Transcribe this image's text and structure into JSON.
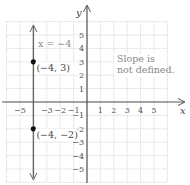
{
  "chart_data": {
    "type": "line",
    "title": "",
    "xlabel": "x",
    "ylabel": "y",
    "xlim": [
      -6,
      6
    ],
    "ylim": [
      -6,
      6
    ],
    "grid": true,
    "x_ticks": [
      -5,
      -3,
      -2,
      -1,
      1,
      2,
      3,
      4,
      5
    ],
    "y_ticks": [
      5,
      4,
      3,
      2,
      1,
      -1,
      -2,
      -3,
      -4,
      -5
    ],
    "series": [
      {
        "name": "x = -4",
        "kind": "vertical-line",
        "x": -4,
        "color": "#666666"
      }
    ],
    "points": [
      {
        "x": -4,
        "y": 3,
        "label": "(−4, 3)"
      },
      {
        "x": -4,
        "y": -2,
        "label": "(−4, −2)"
      }
    ],
    "annotations": {
      "equation": "x = −4",
      "note_line1": "Slope is",
      "note_line2": "not defined."
    }
  }
}
